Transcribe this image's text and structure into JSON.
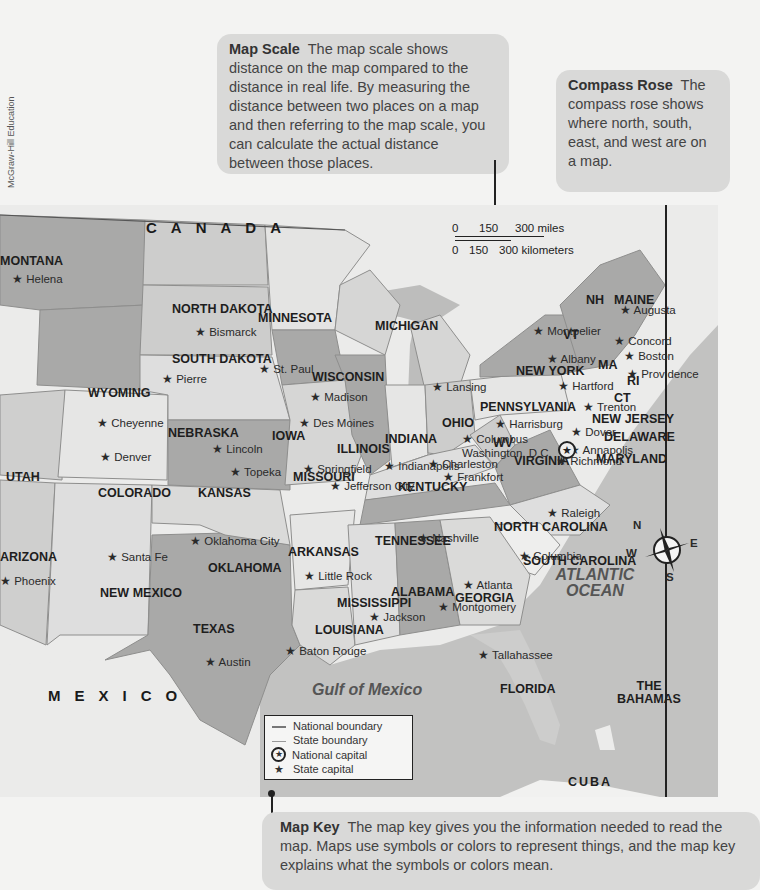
{
  "credit": "McGraw-Hill Education",
  "callouts": {
    "map_scale": {
      "title": "Map Scale",
      "text": "The map scale shows distance on the map compared to the distance in real life. By measuring the distance between two places on a map and then referring to the map scale, you can calculate the actual distance between those places."
    },
    "compass_rose": {
      "title": "Compass Rose",
      "text": "The compass rose shows where north, south, east, and west are on a map."
    },
    "map_key": {
      "title": "Map Key",
      "text": "The map key gives you the information needed to read the map. Maps use symbols or colors to represent things, and the map key explains what the symbols or colors mean."
    }
  },
  "scale": {
    "miles": [
      "0",
      "150",
      "300 miles"
    ],
    "km": [
      "0",
      "150",
      "300 kilometers"
    ]
  },
  "compass": {
    "n": "N",
    "s": "S",
    "e": "E",
    "w": "W"
  },
  "legend": {
    "national_boundary": "National boundary",
    "state_boundary": "State boundary",
    "national_capital": "National capital",
    "state_capital": "State capital"
  },
  "countries": {
    "canada": "CANADA",
    "mexico": "MEXICO",
    "bahamas": "THE BAHAMAS",
    "cuba": "CUBA"
  },
  "water": {
    "atlantic": "ATLANTIC OCEAN",
    "gulf": "Gulf of Mexico"
  },
  "states": [
    {
      "name": "MONTANA",
      "x": 0,
      "y": 50
    },
    {
      "name": "NORTH DAKOTA",
      "x": 172,
      "y": 98
    },
    {
      "name": "SOUTH DAKOTA",
      "x": 172,
      "y": 148
    },
    {
      "name": "MINNESOTA",
      "x": 258,
      "y": 107
    },
    {
      "name": "WYOMING",
      "x": 88,
      "y": 182
    },
    {
      "name": "WISCONSIN",
      "x": 312,
      "y": 166
    },
    {
      "name": "IOWA",
      "x": 272,
      "y": 225
    },
    {
      "name": "NEBRASKA",
      "x": 168,
      "y": 222
    },
    {
      "name": "UTAH",
      "x": 6,
      "y": 266
    },
    {
      "name": "COLORADO",
      "x": 98,
      "y": 282
    },
    {
      "name": "KANSAS",
      "x": 198,
      "y": 282
    },
    {
      "name": "ILLINOIS",
      "x": 337,
      "y": 238
    },
    {
      "name": "INDIANA",
      "x": 385,
      "y": 228
    },
    {
      "name": "OHIO",
      "x": 442,
      "y": 212
    },
    {
      "name": "MISSOURI",
      "x": 293,
      "y": 266
    },
    {
      "name": "KENTUCKY",
      "x": 398,
      "y": 276
    },
    {
      "name": "WV",
      "x": 493,
      "y": 232
    },
    {
      "name": "VIRGINIA",
      "x": 514,
      "y": 250
    },
    {
      "name": "PENNSYLVANIA",
      "x": 480,
      "y": 196
    },
    {
      "name": "NEW YORK",
      "x": 516,
      "y": 160
    },
    {
      "name": "NEW JERSEY",
      "x": 592,
      "y": 208
    },
    {
      "name": "DELAWARE",
      "x": 604,
      "y": 226
    },
    {
      "name": "MARYLAND",
      "x": 596,
      "y": 248
    },
    {
      "name": "CT",
      "x": 614,
      "y": 187
    },
    {
      "name": "RI",
      "x": 627,
      "y": 170
    },
    {
      "name": "MA",
      "x": 598,
      "y": 154
    },
    {
      "name": "VT",
      "x": 563,
      "y": 124
    },
    {
      "name": "NH",
      "x": 586,
      "y": 89
    },
    {
      "name": "MAINE",
      "x": 614,
      "y": 89
    },
    {
      "name": "MICHIGAN",
      "x": 375,
      "y": 115
    },
    {
      "name": "NORTH CAROLINA",
      "x": 494,
      "y": 316
    },
    {
      "name": "TENNESSEE",
      "x": 375,
      "y": 330
    },
    {
      "name": "ARKANSAS",
      "x": 288,
      "y": 341
    },
    {
      "name": "OKLAHOMA",
      "x": 208,
      "y": 357
    },
    {
      "name": "NEW MEXICO",
      "x": 100,
      "y": 382
    },
    {
      "name": "ARIZONA",
      "x": 0,
      "y": 346
    },
    {
      "name": "TEXAS",
      "x": 193,
      "y": 418
    },
    {
      "name": "MISSISSIPPI",
      "x": 337,
      "y": 392
    },
    {
      "name": "ALABAMA",
      "x": 391,
      "y": 381
    },
    {
      "name": "GEORGIA",
      "x": 455,
      "y": 387
    },
    {
      "name": "SOUTH CAROLINA",
      "x": 523,
      "y": 350
    },
    {
      "name": "LOUISIANA",
      "x": 315,
      "y": 419
    },
    {
      "name": "FLORIDA",
      "x": 500,
      "y": 478
    }
  ],
  "capitals": [
    {
      "name": "Helena",
      "x": 12,
      "y": 68
    },
    {
      "name": "Bismarck",
      "x": 195,
      "y": 121
    },
    {
      "name": "Pierre",
      "x": 162,
      "y": 168
    },
    {
      "name": "St. Paul",
      "x": 259,
      "y": 158
    },
    {
      "name": "Madison",
      "x": 310,
      "y": 186
    },
    {
      "name": "Lansing",
      "x": 432,
      "y": 176
    },
    {
      "name": "Des Moines",
      "x": 299,
      "y": 212
    },
    {
      "name": "Lincoln",
      "x": 212,
      "y": 238
    },
    {
      "name": "Cheyenne",
      "x": 97,
      "y": 212
    },
    {
      "name": "Denver",
      "x": 100,
      "y": 246
    },
    {
      "name": "Topeka",
      "x": 230,
      "y": 261
    },
    {
      "name": "Springfield",
      "x": 303,
      "y": 258
    },
    {
      "name": "Jefferson City",
      "x": 330,
      "y": 275
    },
    {
      "name": "Indianapolis",
      "x": 384,
      "y": 255
    },
    {
      "name": "Columbus",
      "x": 462,
      "y": 228
    },
    {
      "name": "Washington, D.C.",
      "x": 462,
      "y": 242
    },
    {
      "name": "Charleston",
      "x": 428,
      "y": 253
    },
    {
      "name": "Frankfort",
      "x": 443,
      "y": 266
    },
    {
      "name": "Harrisburg",
      "x": 495,
      "y": 213
    },
    {
      "name": "Montpelier",
      "x": 533,
      "y": 120
    },
    {
      "name": "Albany",
      "x": 547,
      "y": 148
    },
    {
      "name": "Concord",
      "x": 614,
      "y": 130
    },
    {
      "name": "Boston",
      "x": 624,
      "y": 145
    },
    {
      "name": "Providence",
      "x": 627,
      "y": 163
    },
    {
      "name": "Hartford",
      "x": 558,
      "y": 175
    },
    {
      "name": "Trenton",
      "x": 583,
      "y": 196
    },
    {
      "name": "Dover",
      "x": 571,
      "y": 221
    },
    {
      "name": "Annapolis",
      "x": 569,
      "y": 239
    },
    {
      "name": "Richmond",
      "x": 556,
      "y": 250
    },
    {
      "name": "Raleigh",
      "x": 547,
      "y": 302
    },
    {
      "name": "Augusta",
      "x": 620,
      "y": 99
    },
    {
      "name": "Nashville",
      "x": 418,
      "y": 327
    },
    {
      "name": "Columbia",
      "x": 519,
      "y": 345
    },
    {
      "name": "Atlanta",
      "x": 463,
      "y": 374
    },
    {
      "name": "Montgomery",
      "x": 438,
      "y": 396
    },
    {
      "name": "Jackson",
      "x": 369,
      "y": 406
    },
    {
      "name": "Little Rock",
      "x": 304,
      "y": 365
    },
    {
      "name": "Oklahoma City",
      "x": 190,
      "y": 330
    },
    {
      "name": "Santa Fe",
      "x": 107,
      "y": 346
    },
    {
      "name": "Phoenix",
      "x": 0,
      "y": 370
    },
    {
      "name": "Austin",
      "x": 205,
      "y": 451
    },
    {
      "name": "Baton Rouge",
      "x": 285,
      "y": 440
    },
    {
      "name": "Tallahassee",
      "x": 478,
      "y": 444
    }
  ],
  "colors": {
    "page": "#f3f3f2",
    "callout": "#d9d9d8",
    "land_light": "#e4e4e3",
    "land_mid": "#c9c9c8",
    "land_dark": "#a9a9a8",
    "water": "#c2c2c1",
    "foreign": "#ebebea"
  }
}
